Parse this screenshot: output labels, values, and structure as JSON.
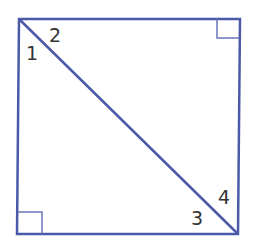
{
  "diagram": {
    "type": "square-with-diagonal",
    "stroke_color": "#4a5aa8",
    "label_color": "#333333",
    "angle_labels": [
      {
        "id": "1",
        "text": "1",
        "position": "top-left, below diagonal"
      },
      {
        "id": "2",
        "text": "2",
        "position": "top-left, above diagonal"
      },
      {
        "id": "3",
        "text": "3",
        "position": "bottom-right, below diagonal"
      },
      {
        "id": "4",
        "text": "4",
        "position": "bottom-right, above diagonal"
      }
    ],
    "right_angle_markers": [
      "top-right",
      "bottom-left"
    ]
  }
}
